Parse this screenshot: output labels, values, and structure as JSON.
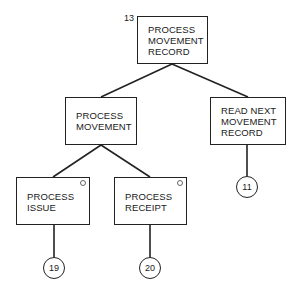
{
  "diagram": {
    "type": "structure-chart",
    "root": {
      "number": "13",
      "label": "PROCESS\nMOVEMENT\nRECORD"
    },
    "nodes": {
      "process_movement": {
        "label": "PROCESS\nMOVEMENT"
      },
      "read_next": {
        "label": "READ NEXT\nMOVEMENT\nRECORD",
        "connector": "11"
      },
      "process_issue": {
        "label": "PROCESS\nISSUE",
        "connector": "19",
        "selection_mark": true
      },
      "process_receipt": {
        "label": "PROCESS\nRECEIPT",
        "connector": "20",
        "selection_mark": true
      }
    },
    "edges": [
      [
        "PROCESS MOVEMENT RECORD",
        "PROCESS MOVEMENT"
      ],
      [
        "PROCESS MOVEMENT RECORD",
        "READ NEXT MOVEMENT RECORD"
      ],
      [
        "PROCESS MOVEMENT",
        "PROCESS ISSUE"
      ],
      [
        "PROCESS MOVEMENT",
        "PROCESS RECEIPT"
      ],
      [
        "READ NEXT MOVEMENT RECORD",
        "11"
      ],
      [
        "PROCESS ISSUE",
        "19"
      ],
      [
        "PROCESS RECEIPT",
        "20"
      ]
    ]
  }
}
